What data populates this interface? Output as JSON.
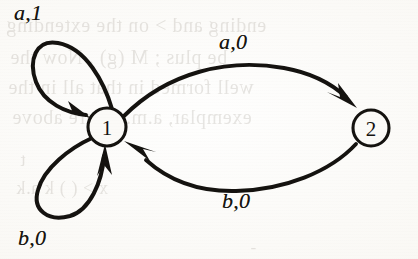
{
  "figure": {
    "kind": "finite-state-transducer",
    "medium": "scanned-book-page",
    "paper_color": "#faf9f6",
    "ink_color": "#14120f"
  },
  "states": [
    {
      "id": "1",
      "label": "1",
      "cx": 107,
      "cy": 127,
      "r": 19
    },
    {
      "id": "2",
      "label": "2",
      "cx": 371,
      "cy": 128,
      "r": 18
    }
  ],
  "transitions": [
    {
      "name": "self-loop-upper",
      "from": "1",
      "to": "1",
      "input": "a",
      "output": "1",
      "label": "a,1",
      "label_x": 14,
      "label_y": 0
    },
    {
      "name": "edge-one-to-two",
      "from": "1",
      "to": "2",
      "input": "a",
      "output": "0",
      "label": "a,0",
      "label_x": 219,
      "label_y": 29
    },
    {
      "name": "edge-two-to-one",
      "from": "2",
      "to": "1",
      "input": "b",
      "output": "0",
      "label": "b,0",
      "label_x": 222,
      "label_y": 188
    },
    {
      "name": "self-loop-lower",
      "from": "1",
      "to": "1",
      "input": "b",
      "output": "0",
      "label": "b,0",
      "label_x": 18,
      "label_y": 225
    }
  ],
  "ghost_text": [
    {
      "text": "ending    and > on the extending",
      "x": 6,
      "y": 14,
      "size": 20
    },
    {
      "text": "be plus ;  M (g) . Now the",
      "x": 10,
      "y": 46,
      "size": 20
    },
    {
      "text": "well formed in that all in the",
      "x": 8,
      "y": 76,
      "size": 20
    },
    {
      "text": "exemplar,   a.m.  figure above",
      "x": 12,
      "y": 106,
      "size": 20
    },
    {
      "text": "t",
      "x": 20,
      "y": 150,
      "size": 18
    },
    {
      "text": "x  >   (  )    k     a.k",
      "x": 16,
      "y": 178,
      "size": 18
    },
    {
      "text": "-",
      "x": 250,
      "y": 238,
      "size": 17
    }
  ]
}
